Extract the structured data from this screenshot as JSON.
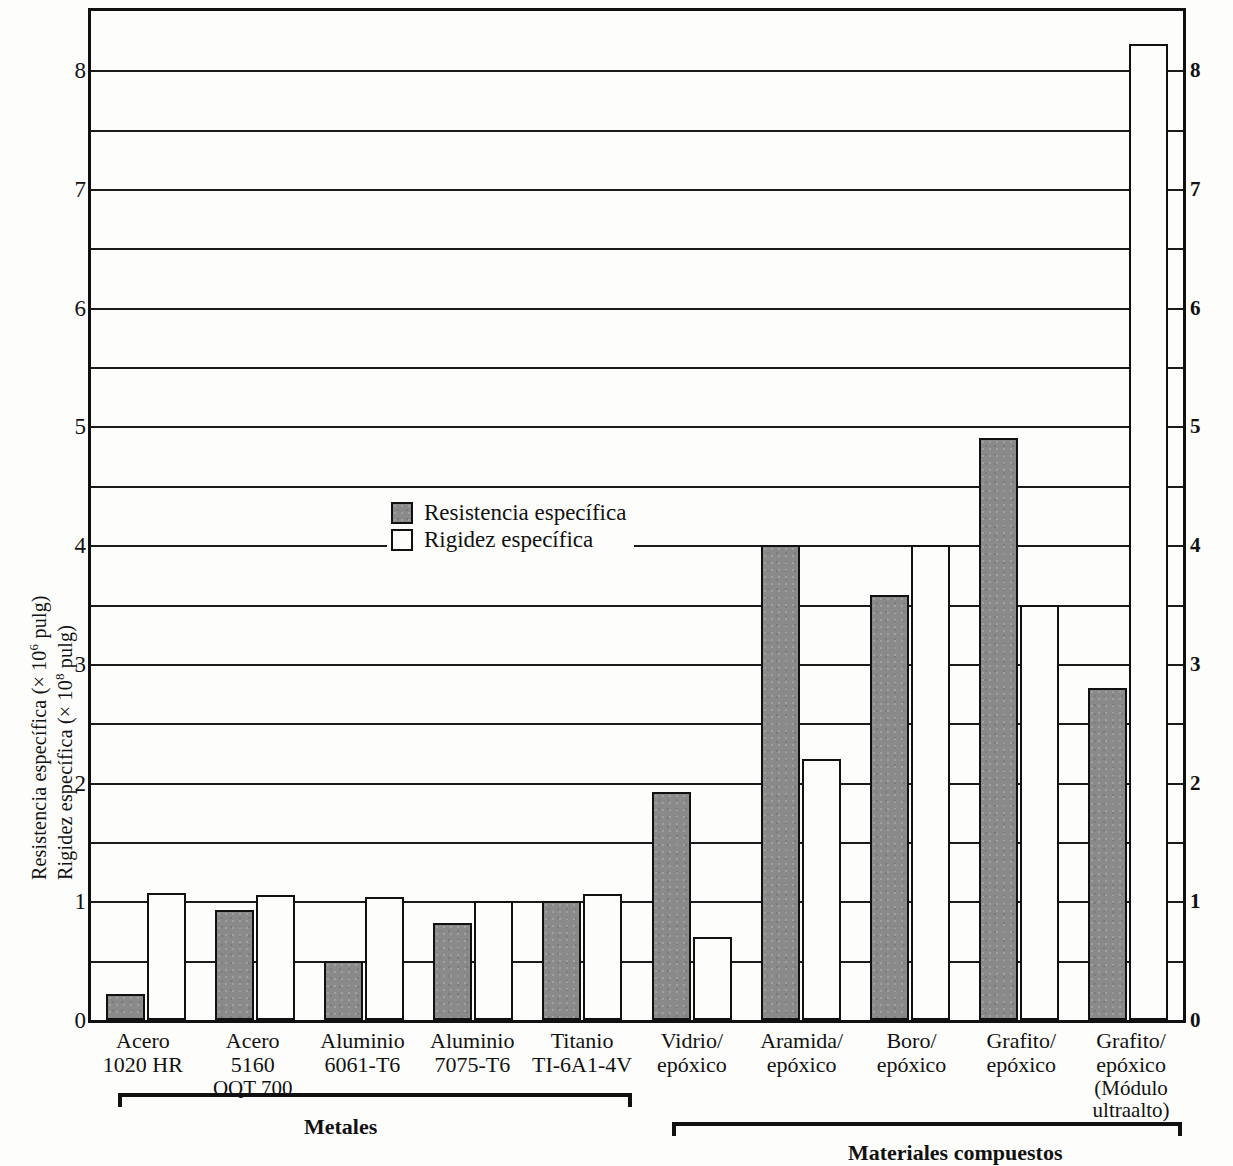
{
  "axis": {
    "y_title_line1": "Resistencia específica (× 10",
    "y_title_line1_exp": "6",
    "y_title_line1_end": " pulg)",
    "y_title_line2": "Rigidez específica (× 10",
    "y_title_line2_exp": "8",
    "y_title_line2_end": " pulg)",
    "ticks": [
      "0",
      "1",
      "2",
      "3",
      "4",
      "5",
      "6",
      "7",
      "8"
    ]
  },
  "legend": {
    "items": [
      {
        "label": "Resistencia específica",
        "swatch": "gray-filled-square",
        "color": "#8a8a8a"
      },
      {
        "label": "Rigidez específica",
        "swatch": "white-square",
        "color": "#ffffff"
      }
    ]
  },
  "groups": [
    {
      "name": "Metales",
      "label": "Metales"
    },
    {
      "name": "Materiales compuestos",
      "label": "Materiales compuestos"
    }
  ],
  "chart_data": {
    "type": "bar",
    "title": "",
    "xlabel": "",
    "ylabel": "Resistencia específica (× 10^6 pulg) / Rigidez específica (× 10^8 pulg)",
    "ylim": [
      0,
      8.5
    ],
    "ytick_values": [
      0,
      1,
      2,
      3,
      4,
      5,
      6,
      7,
      8
    ],
    "minor_gridlines": [
      0.5,
      1.5,
      2.5,
      3.5,
      4.5,
      5.5,
      6.5,
      7.5
    ],
    "grid": true,
    "legend_position": "upper-left-inside",
    "dual_axis": true,
    "categories": [
      [
        "Acero",
        "1020 HR"
      ],
      [
        "Acero",
        "5160",
        "OQT 700"
      ],
      [
        "Aluminio",
        "6061-T6"
      ],
      [
        "Aluminio",
        "7075-T6"
      ],
      [
        "Titanio",
        "TI-6A1-4V"
      ],
      [
        "Vidrio/",
        "epóxico"
      ],
      [
        "Aramida/",
        "epóxico"
      ],
      [
        "Boro/",
        "epóxico"
      ],
      [
        "Grafito/",
        "epóxico"
      ],
      [
        "Grafito/",
        "epóxico",
        "(Módulo",
        "ultraalto)"
      ]
    ],
    "category_groups": [
      "Metales",
      "Metales",
      "Metales",
      "Metales",
      "Metales",
      "Materiales compuestos",
      "Materiales compuestos",
      "Materiales compuestos",
      "Materiales compuestos",
      "Materiales compuestos"
    ],
    "series": [
      {
        "name": "Resistencia específica",
        "color": "#8a8a8a",
        "values": [
          0.22,
          0.93,
          0.5,
          0.82,
          1.0,
          1.92,
          4.0,
          3.58,
          4.9,
          2.8
        ]
      },
      {
        "name": "Rigidez específica",
        "color": "#ffffff",
        "values": [
          1.07,
          1.05,
          1.04,
          1.0,
          1.06,
          0.7,
          2.2,
          4.0,
          3.5,
          8.22
        ]
      }
    ]
  }
}
